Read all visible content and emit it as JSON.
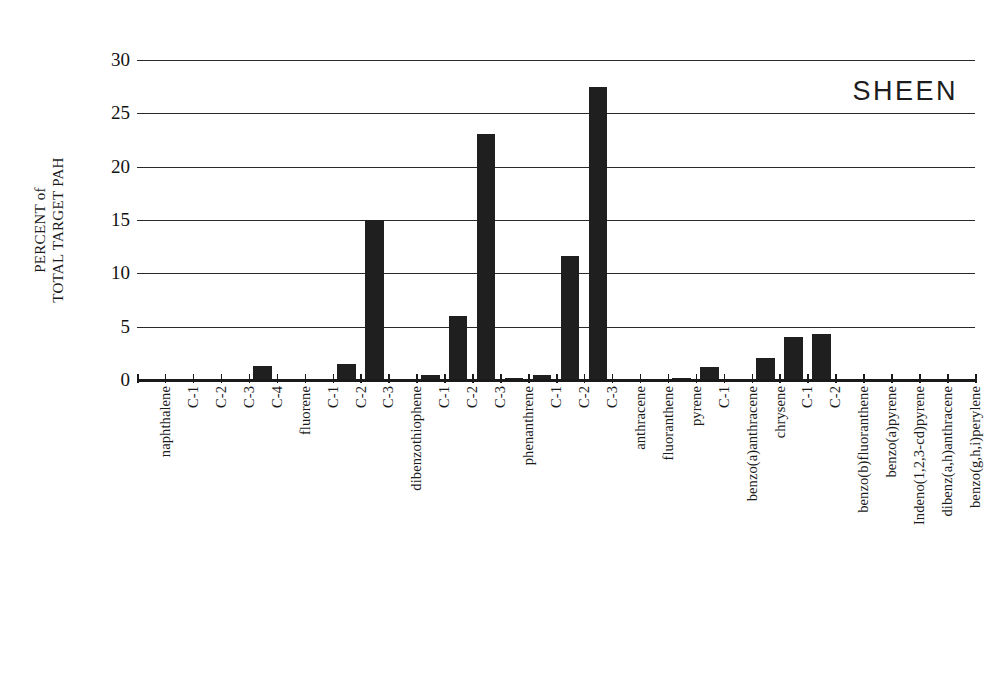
{
  "chart_data": {
    "type": "bar",
    "title": "SHEEN",
    "xlabel": "",
    "ylabel": "PERCENT of TOTAL TARGET PAH",
    "ylabel_line1": "PERCENT of",
    "ylabel_line2": "TOTAL TARGET PAH",
    "ylim": [
      0,
      30
    ],
    "ytick_labels": [
      "30",
      "25",
      "20",
      "15",
      "10",
      "5",
      "0"
    ],
    "ytick_values": [
      30,
      25,
      20,
      15,
      10,
      5,
      0
    ],
    "grid": true,
    "legend": "none",
    "bar_color": "#1f1f1f",
    "categories": [
      "naphthalene",
      "C-1",
      "C-2",
      "C-3",
      "C-4",
      "fluorene",
      "C-1",
      "C-2",
      "C-3",
      "dibenzothiophene",
      "C-1",
      "C-2",
      "C-3",
      "phenanthrene",
      "C-1",
      "C-2",
      "C-3",
      "anthracene",
      "fluoranthene",
      "pyrene",
      "C-1",
      "benzo(a)anthracene",
      "chrysene",
      "C-1",
      "C-2",
      "benzo(b)fluoranthene",
      "benzo(a)pyrene",
      "Indeno(1,2,3-cd)pyrene",
      "dibenz(a,h)anthracene",
      "benzo(g,h,i)perylene"
    ],
    "values": [
      0.0,
      0.0,
      0.0,
      0.0,
      1.3,
      0.0,
      0.0,
      1.5,
      15.0,
      0.0,
      0.5,
      6.0,
      23.1,
      0.2,
      0.5,
      11.6,
      27.5,
      0.0,
      0.0,
      0.15,
      1.2,
      0.0,
      2.1,
      4.0,
      4.35,
      0.0,
      0.0,
      0.0,
      0.0,
      0.0
    ]
  }
}
